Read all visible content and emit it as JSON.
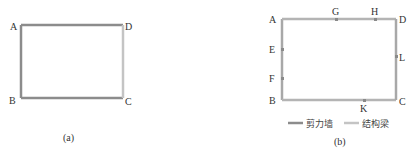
{
  "colors": {
    "shear_wall": "#8c8c8c",
    "structural_beam": "#c4c4c4",
    "label": "#333333",
    "node_marker": "#8a8a8a"
  },
  "figure_a": {
    "caption": "(a)",
    "labels": {
      "A": "A",
      "B": "B",
      "C": "C",
      "D": "D"
    }
  },
  "figure_b": {
    "caption": "(b)",
    "labels": {
      "A": "A",
      "B": "B",
      "C": "C",
      "D": "D",
      "E": "E",
      "F": "F",
      "G": "G",
      "H": "H",
      "K": "K",
      "L": "L"
    },
    "legend": {
      "shear_wall": "剪力墙",
      "structural_beam": "结构梁"
    }
  }
}
